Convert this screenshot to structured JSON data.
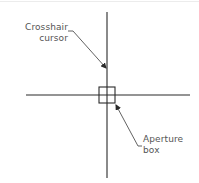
{
  "diagram": {
    "colors": {
      "line": "#2a2a2a",
      "leader": "#3a3a3a",
      "text": "#555555",
      "background": "#ffffff"
    },
    "labels": {
      "crosshair": {
        "line1": "Crosshair",
        "line2": "cursor"
      },
      "aperture": {
        "line1": "Aperture",
        "line2": "box"
      }
    },
    "geometry": {
      "vertical_line": {
        "x": 107,
        "y1": 12,
        "y2": 178
      },
      "horizontal_line": {
        "y": 95,
        "x1": 26,
        "x2": 190
      },
      "aperture_box": {
        "x": 99,
        "y": 87,
        "size": 16
      }
    }
  }
}
